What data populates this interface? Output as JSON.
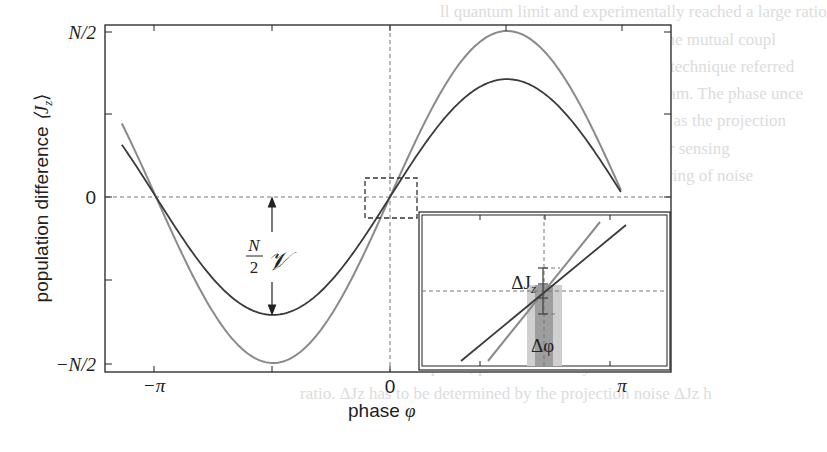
{
  "chart_data": {
    "type": "line",
    "title": "",
    "xlabel": "phase φ",
    "ylabel": "population difference ⟨J_z⟩",
    "x_ticks": [
      {
        "label": "−π",
        "value": -3.14159
      },
      {
        "label": "0",
        "value": 0
      },
      {
        "label": "π",
        "value": 3.14159
      }
    ],
    "y_ticks": [
      {
        "label": "N/2",
        "value": 1.0
      },
      {
        "label": "0",
        "value": 0.0
      },
      {
        "label": "−N/2",
        "value": -1.0
      }
    ],
    "xlim": [
      -4.7,
      3.5
    ],
    "ylim": [
      -1.05,
      1.05
    ],
    "grid": false,
    "reference_lines": {
      "x": 0,
      "y": 0,
      "style": "dashed"
    },
    "series": [
      {
        "name": "full visibility (V = 1)",
        "color": "#8a8a8a",
        "formula": "(N/2)·sin(φ)",
        "amplitude": 1.0,
        "x_range": [
          -3.6,
          3.1
        ]
      },
      {
        "name": "reduced visibility (V ≈ 0.71)",
        "color": "#3a3a3a",
        "formula": "(N/2)·V·sin(φ)",
        "amplitude": 0.71,
        "x_range": [
          -3.6,
          3.1
        ]
      }
    ],
    "annotations": [
      {
        "text": "N/2 V",
        "meaning": "amplitude (N/2)·𝒱 marked by double arrow at φ = −π/2"
      },
      {
        "text": "ΔJ_z",
        "meaning": "projection noise error bar (inset)"
      },
      {
        "text": "Δφ",
        "meaning": "phase uncertainty band (inset)"
      }
    ],
    "inset": {
      "description": "zoom of dashed region near φ = 0, J_z = 0",
      "labels": [
        "ΔJ_z",
        "Δφ"
      ]
    }
  },
  "labels": {
    "y_top": "N/2",
    "y_zero": "0",
    "y_bottom": "−N/2",
    "x_left": "−π",
    "x_mid": "0",
    "x_right": "π",
    "xlabel_text": "phase ",
    "xlabel_sym": "φ",
    "ylabel_text": "population difference  ",
    "ylabel_sym": "⟨J",
    "ylabel_sub": "z",
    "ylabel_close": "⟩",
    "amp_num": "N",
    "amp_den": "2",
    "amp_sym": "𝒱",
    "dJ": "ΔJ",
    "dJ_sub": "z",
    "dphi": "Δφ"
  },
  "background_text": [
    "ll quantum limit and experimentally reached a large ratio",
    "technical noise from the readout of the mutual coupl",
    "large pure quantum noise stage. The technique referred",
    "ured by a degenerate parametric beam. The phase unce",
    "mal surface of the Bloch sphere, ΔJz as the projection",
    "the number of atoms in the beams for sensing",
    "was effectively extended into measuring of noise",
    "ce the ratio between signal and noise ν",
    "occur with the quantum state of a simply measured",
    "information on the phase, phase sensitivity is limit",
    "ratio. ΔJz has to be determined by the projection noise ΔJz h"
  ]
}
